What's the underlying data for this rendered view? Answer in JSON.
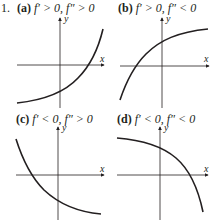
{
  "exercise_number": "1.",
  "panels": [
    {
      "id": "a",
      "tag": "(a)",
      "cond1": "f′ > 0,",
      "cond2": "f″ > 0",
      "x_axis_label": "x",
      "y_axis_label": "y",
      "description": "increasing, concave up"
    },
    {
      "id": "b",
      "tag": "(b)",
      "cond1": "f′ > 0,",
      "cond2": "f″ < 0",
      "x_axis_label": "x",
      "y_axis_label": "y",
      "description": "increasing, concave down"
    },
    {
      "id": "c",
      "tag": "(c)",
      "cond1": "f′ < 0,",
      "cond2": "f″ > 0",
      "x_axis_label": "x",
      "y_axis_label": "y",
      "description": "decreasing, concave up"
    },
    {
      "id": "d",
      "tag": "(d)",
      "cond1": "f′ < 0,",
      "cond2": "f″ < 0",
      "x_axis_label": "x",
      "y_axis_label": "y",
      "description": "decreasing, concave down"
    }
  ],
  "colors": {
    "ink": "#231f20",
    "background": "#ffffff"
  }
}
